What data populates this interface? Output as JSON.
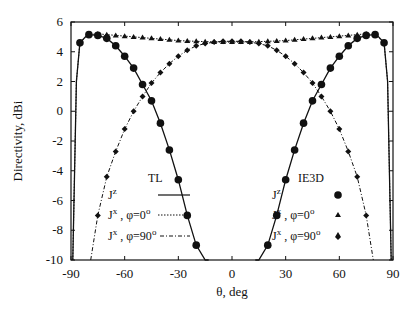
{
  "chart_data": {
    "type": "line",
    "title": "",
    "xlabel": "θ, deg",
    "ylabel": "Directivity, dBi",
    "xlim": [
      -90,
      90
    ],
    "ylim": [
      -10,
      6
    ],
    "xticks": [
      -90,
      -60,
      -30,
      0,
      30,
      60,
      90
    ],
    "yticks": [
      -10,
      -8,
      -6,
      -4,
      -2,
      0,
      2,
      4,
      6
    ],
    "grid": false,
    "legend_groups": [
      {
        "title": "TL",
        "entries": [
          {
            "label": "J^z",
            "style": "solid"
          },
          {
            "label": "J^x , φ=0°",
            "style": "dotted"
          },
          {
            "label": "J^x , φ=90°",
            "style": "dashed"
          }
        ]
      },
      {
        "title": "IE3D",
        "entries": [
          {
            "label": "J^z",
            "marker": "circle"
          },
          {
            "label": "J^x , φ=0°",
            "marker": "triangle"
          },
          {
            "label": "J^x , φ=90°",
            "marker": "diamond"
          }
        ]
      }
    ],
    "series": [
      {
        "name": "Jz (TL)",
        "style": "solid",
        "marker": "circle",
        "x": [
          -89,
          -87,
          -85,
          -82,
          -80,
          -75,
          -70,
          -65,
          -60,
          -55,
          -50,
          -45,
          -40,
          -35,
          -30,
          -25,
          -20,
          -15,
          -13
        ],
        "y": [
          -10,
          2.0,
          4.6,
          5.0,
          5.15,
          5.1,
          4.9,
          4.4,
          3.7,
          2.9,
          1.8,
          0.7,
          -0.8,
          -2.6,
          -4.6,
          -7.0,
          -9.0,
          -10,
          -10
        ]
      },
      {
        "name": "Jz (TL) mirror",
        "style": "solid",
        "marker": "circle",
        "x": [
          13,
          15,
          20,
          25,
          30,
          35,
          40,
          45,
          50,
          55,
          60,
          65,
          70,
          75,
          80,
          82,
          85,
          87,
          89
        ],
        "y": [
          -10,
          -10,
          -9.0,
          -7.0,
          -4.6,
          -2.6,
          -0.8,
          0.7,
          1.8,
          2.9,
          3.7,
          4.4,
          4.9,
          5.1,
          5.15,
          5.0,
          4.6,
          2.0,
          -10
        ]
      },
      {
        "name": "Jx φ=0° (TL)",
        "style": "dotted",
        "marker": "triangle",
        "x": [
          -89,
          -87,
          -85,
          -80,
          -75,
          -70,
          -65,
          -60,
          -55,
          -50,
          -45,
          -40,
          -35,
          -30,
          -25,
          -20,
          -15,
          -10,
          -5,
          0,
          5,
          10,
          15,
          20,
          25,
          30,
          35,
          40,
          45,
          50,
          55,
          60,
          65,
          70,
          75,
          80,
          85,
          87,
          89
        ],
        "y": [
          -10,
          2.0,
          4.6,
          5.15,
          5.2,
          5.15,
          5.1,
          5.05,
          5.0,
          4.95,
          4.9,
          4.85,
          4.8,
          4.75,
          4.72,
          4.7,
          4.68,
          4.66,
          4.65,
          4.65,
          4.65,
          4.66,
          4.68,
          4.7,
          4.72,
          4.75,
          4.8,
          4.85,
          4.9,
          4.95,
          5.0,
          5.05,
          5.1,
          5.15,
          5.2,
          5.15,
          4.6,
          2.0,
          -10
        ]
      },
      {
        "name": "Jx φ=90° (TL)",
        "style": "dashed",
        "marker": "diamond",
        "x": [
          -79,
          -75,
          -70,
          -65,
          -60,
          -55,
          -50,
          -45,
          -40,
          -35,
          -30,
          -25,
          -20,
          -15,
          -10,
          -5,
          0,
          5,
          10,
          15,
          20,
          25,
          30,
          35,
          40,
          45,
          50,
          55,
          60,
          65,
          70,
          75,
          79
        ],
        "y": [
          -10,
          -7.0,
          -4.4,
          -2.7,
          -1.2,
          0.0,
          1.0,
          1.9,
          2.6,
          3.2,
          3.7,
          4.1,
          4.4,
          4.55,
          4.65,
          4.7,
          4.7,
          4.7,
          4.65,
          4.55,
          4.4,
          4.1,
          3.7,
          3.2,
          2.6,
          1.9,
          1.0,
          0.0,
          -1.2,
          -2.7,
          -4.4,
          -7.0,
          -10
        ]
      }
    ]
  },
  "markers": {
    "circle": {
      "x": [
        -85,
        -80,
        -75,
        -70,
        -65,
        -60,
        -55,
        -50,
        -45,
        -40,
        -35,
        -30,
        -25,
        -20,
        -15,
        15,
        20,
        25,
        30,
        35,
        40,
        45,
        50,
        55,
        60,
        65,
        70,
        75,
        80,
        85
      ]
    },
    "triangle": {
      "x": [
        -80,
        -75,
        -70,
        -65,
        -60,
        -55,
        -50,
        -45,
        -40,
        -35,
        -30,
        -25,
        -20,
        -15,
        -10,
        -5,
        0,
        5,
        10,
        15,
        20,
        25,
        30,
        35,
        40,
        45,
        50,
        55,
        60,
        65,
        70,
        75,
        80
      ]
    },
    "diamond": {
      "x": [
        -75,
        -70,
        -65,
        -60,
        -55,
        -50,
        -45,
        -40,
        -35,
        -30,
        -25,
        -20,
        -15,
        -10,
        -5,
        0,
        5,
        10,
        15,
        20,
        25,
        30,
        35,
        40,
        45,
        50,
        55,
        60,
        65,
        70,
        75
      ]
    }
  },
  "labels": {
    "tl_title": "TL",
    "ie3d_title": "IE3D",
    "xlabel": "θ, deg",
    "ylabel": "Directivity, dBi"
  }
}
